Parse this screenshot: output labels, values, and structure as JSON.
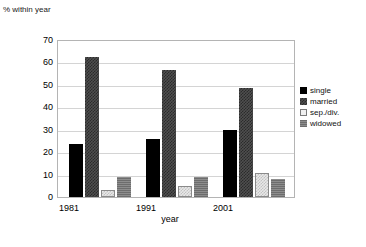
{
  "chart_data": {
    "type": "bar",
    "title": "",
    "ylabel": "% within year",
    "xlabel": "year",
    "categories": [
      "1981",
      "1991",
      "2001"
    ],
    "ylim": [
      0,
      70
    ],
    "yticks": [
      0,
      10,
      20,
      30,
      40,
      50,
      60,
      70
    ],
    "ytick_labels": [
      "0",
      "10",
      "20",
      "30",
      "40",
      "50",
      "60",
      "70"
    ],
    "grid": true,
    "legend_position": "right",
    "series": [
      {
        "name": "single",
        "values": [
          24,
          26,
          30
        ],
        "color": "#000000"
      },
      {
        "name": "married",
        "values": [
          63,
          57,
          49
        ],
        "color": "#4f4f4f"
      },
      {
        "name": "sep./div.",
        "values": [
          3,
          5,
          11
        ],
        "color": "#e8e8e8"
      },
      {
        "name": "widowed",
        "values": [
          9,
          9,
          8
        ],
        "color": "#7d7d7d"
      }
    ]
  },
  "axes": {
    "y_title": "% within year",
    "x_title": "year",
    "y_tick_labels": [
      "70",
      "60",
      "50",
      "40",
      "30",
      "20",
      "10",
      "0"
    ],
    "x_tick_labels": [
      "1981",
      "1991",
      "2001"
    ]
  },
  "legend": {
    "items": [
      {
        "label": "single"
      },
      {
        "label": "married"
      },
      {
        "label": "sep./div."
      },
      {
        "label": "widowed"
      }
    ]
  }
}
